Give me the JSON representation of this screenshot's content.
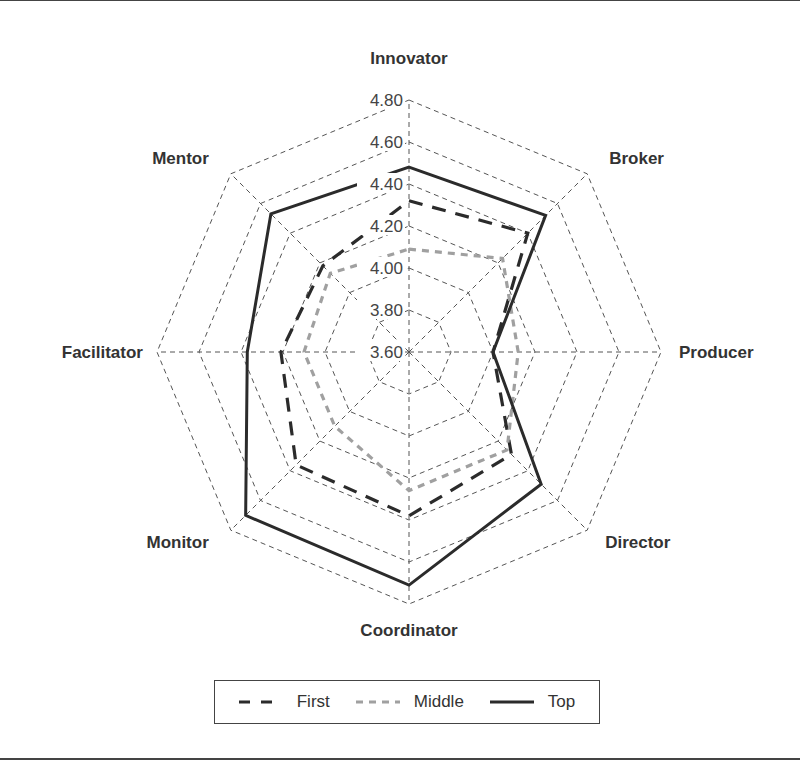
{
  "chart_data": {
    "type": "radar",
    "title": "",
    "axes": [
      "Innovator",
      "Broker",
      "Producer",
      "Director",
      "Coordinator",
      "Monitor",
      "Facilitator",
      "Mentor"
    ],
    "radial_ticks": [
      "3.60",
      "3.80",
      "4.00",
      "4.20",
      "4.40",
      "4.60",
      "4.80"
    ],
    "rlim": [
      3.6,
      4.8
    ],
    "grid": true,
    "legend_position": "bottom",
    "series": [
      {
        "name": "First",
        "style": "dashed",
        "color": "#2b2b2b",
        "values": [
          4.32,
          4.4,
          4.0,
          4.29,
          4.38,
          4.36,
          4.21,
          4.18
        ]
      },
      {
        "name": "Middle",
        "style": "dashed",
        "color": "#a0a0a0",
        "values": [
          4.09,
          4.23,
          4.12,
          4.26,
          4.26,
          4.1,
          4.1,
          4.13
        ]
      },
      {
        "name": "Top",
        "style": "solid",
        "color": "#2b2b2b",
        "values": [
          4.48,
          4.52,
          4.0,
          4.49,
          4.71,
          4.7,
          4.37,
          4.53
        ]
      }
    ]
  },
  "legend": {
    "items": [
      {
        "label": "First"
      },
      {
        "label": "Middle"
      },
      {
        "label": "Top"
      }
    ]
  }
}
